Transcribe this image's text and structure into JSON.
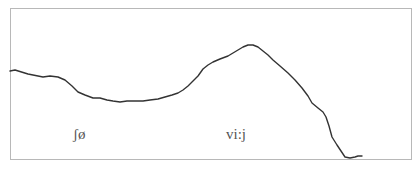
{
  "diagram": {
    "type": "pitch-contour",
    "line_color": "#333333",
    "frame_color": "#b8b8b8",
    "labels": [
      {
        "text": "ʃø"
      },
      {
        "text": "vi:j"
      }
    ],
    "contour_points": [
      [
        10,
        71
      ],
      [
        15,
        70
      ],
      [
        28,
        74
      ],
      [
        43,
        77
      ],
      [
        50,
        76
      ],
      [
        58,
        77
      ],
      [
        65,
        80
      ],
      [
        72,
        86
      ],
      [
        78,
        92
      ],
      [
        85,
        95
      ],
      [
        93,
        98
      ],
      [
        100,
        98
      ],
      [
        107,
        100
      ],
      [
        113,
        101
      ],
      [
        120,
        102
      ],
      [
        127,
        101
      ],
      [
        135,
        101
      ],
      [
        143,
        101
      ],
      [
        150,
        100
      ],
      [
        158,
        99
      ],
      [
        165,
        97
      ],
      [
        172,
        95
      ],
      [
        178,
        93
      ],
      [
        183,
        90
      ],
      [
        188,
        86
      ],
      [
        193,
        81
      ],
      [
        198,
        76
      ],
      [
        203,
        69
      ],
      [
        208,
        65
      ],
      [
        213,
        62
      ],
      [
        220,
        59
      ],
      [
        228,
        56
      ],
      [
        233,
        53
      ],
      [
        238,
        50
      ],
      [
        243,
        47
      ],
      [
        248,
        45
      ],
      [
        253,
        45
      ],
      [
        258,
        47
      ],
      [
        263,
        51
      ],
      [
        268,
        55
      ],
      [
        273,
        60
      ],
      [
        280,
        66
      ],
      [
        288,
        73
      ],
      [
        295,
        80
      ],
      [
        302,
        88
      ],
      [
        308,
        96
      ],
      [
        312,
        103
      ],
      [
        318,
        108
      ],
      [
        323,
        112
      ],
      [
        326,
        117
      ],
      [
        329,
        126
      ],
      [
        332,
        137
      ],
      [
        337,
        145
      ],
      [
        341,
        151
      ],
      [
        345,
        157
      ],
      [
        350,
        158
      ],
      [
        355,
        157
      ],
      [
        358,
        156
      ],
      [
        362,
        156
      ]
    ]
  }
}
